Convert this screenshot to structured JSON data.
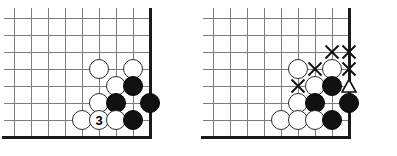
{
  "figure": {
    "kind": "go-board-diagram-pair",
    "stone_diameter": 20,
    "cell": 17
  },
  "boards": [
    {
      "id": "left",
      "name": "left-go-board",
      "origin_x": 14,
      "origin_y": 18,
      "cols": 9,
      "rows": 8,
      "edges": [
        "right",
        "bottom"
      ],
      "stones": [
        {
          "col": 5,
          "row": 3,
          "color": "white",
          "label": ""
        },
        {
          "col": 7,
          "row": 3,
          "color": "white",
          "label": ""
        },
        {
          "col": 6,
          "row": 4,
          "color": "white",
          "label": ""
        },
        {
          "col": 7,
          "row": 4,
          "color": "black",
          "label": ""
        },
        {
          "col": 5,
          "row": 5,
          "color": "white",
          "label": ""
        },
        {
          "col": 6,
          "row": 5,
          "color": "black",
          "label": ""
        },
        {
          "col": 8,
          "row": 5,
          "color": "black",
          "label": ""
        },
        {
          "col": 4,
          "row": 6,
          "color": "white",
          "label": ""
        },
        {
          "col": 5,
          "row": 6,
          "color": "white",
          "label": "3"
        },
        {
          "col": 6,
          "row": 6,
          "color": "white",
          "label": ""
        },
        {
          "col": 7,
          "row": 6,
          "color": "black",
          "label": ""
        }
      ],
      "marks": []
    },
    {
      "id": "right",
      "name": "right-go-board",
      "origin_x": 14,
      "origin_y": 18,
      "cols": 9,
      "rows": 8,
      "edges": [
        "right",
        "bottom"
      ],
      "stones": [
        {
          "col": 5,
          "row": 3,
          "color": "white",
          "label": ""
        },
        {
          "col": 7,
          "row": 3,
          "color": "white",
          "label": ""
        },
        {
          "col": 6,
          "row": 4,
          "color": "white",
          "label": ""
        },
        {
          "col": 7,
          "row": 4,
          "color": "black",
          "label": ""
        },
        {
          "col": 5,
          "row": 5,
          "color": "white",
          "label": ""
        },
        {
          "col": 6,
          "row": 5,
          "color": "black",
          "label": ""
        },
        {
          "col": 8,
          "row": 5,
          "color": "black",
          "label": ""
        },
        {
          "col": 4,
          "row": 6,
          "color": "white",
          "label": ""
        },
        {
          "col": 5,
          "row": 6,
          "color": "white",
          "label": ""
        },
        {
          "col": 6,
          "row": 6,
          "color": "white",
          "label": ""
        },
        {
          "col": 7,
          "row": 6,
          "color": "black",
          "label": ""
        }
      ],
      "marks": [
        {
          "col": 7,
          "row": 2,
          "type": "cross",
          "name": "cross-mark"
        },
        {
          "col": 8,
          "row": 2,
          "type": "cross",
          "name": "cross-mark"
        },
        {
          "col": 6,
          "row": 3,
          "type": "cross",
          "name": "cross-mark"
        },
        {
          "col": 8,
          "row": 3,
          "type": "cross",
          "name": "cross-mark"
        },
        {
          "col": 5,
          "row": 4,
          "type": "cross",
          "name": "cross-mark"
        },
        {
          "col": 8,
          "row": 4,
          "type": "triangle",
          "name": "triangle-mark"
        }
      ]
    }
  ],
  "colors": {
    "grid": "#7d7d7d",
    "edge": "#1a1a1a",
    "black_stone": "#111111",
    "white_stone": "#ffffff",
    "mark": "#111111",
    "background": "#ffffff"
  }
}
